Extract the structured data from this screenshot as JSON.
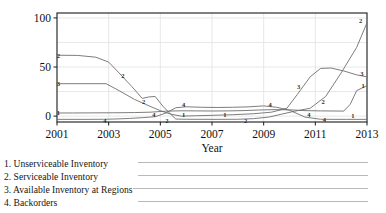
{
  "chart_data": {
    "type": "line",
    "title": "",
    "xlabel": "Year",
    "ylabel": "",
    "xlim": [
      2001,
      2013
    ],
    "ylim": [
      -6,
      105
    ],
    "grid": true,
    "legend_position": "below-left",
    "yticks": [
      "0",
      "50",
      "100"
    ],
    "ytick_values": [
      0,
      50,
      100
    ],
    "xticks": [
      "2001",
      "2003",
      "2005",
      "2007",
      "2009",
      "2011",
      "2013"
    ],
    "xtick_values": [
      2001,
      2003,
      2005,
      2007,
      2009,
      2011,
      2013
    ],
    "series": [
      {
        "key": "1",
        "name": "Unserviceable Inventory",
        "inline_labels": [
          "1",
          "1",
          "1",
          "1",
          "1"
        ],
        "x": [
          2001,
          2001.6,
          2002.4,
          2003.2,
          2004.0,
          2004.6,
          2005.2,
          2005.8,
          2006.4,
          2007.0,
          2007.6,
          2008.2,
          2008.8,
          2009.4,
          2010.0,
          2010.6,
          2011.2,
          2011.8,
          2012.1,
          2012.35,
          2012.6,
          2013
        ],
        "y": [
          3.2,
          3.2,
          3.3,
          3.4,
          3.6,
          4.0,
          5.0,
          5.4,
          5.3,
          5.2,
          5.3,
          5.6,
          6.2,
          6.6,
          6.4,
          5.6,
          5.3,
          5.2,
          5.1,
          12.0,
          26.0,
          31.0
        ]
      },
      {
        "key": "2",
        "name": "Serviceable Inventory",
        "inline_labels": [
          "2",
          "2",
          "2",
          "2",
          "2",
          "2"
        ],
        "x": [
          2001,
          2001.8,
          2002.5,
          2003.0,
          2003.4,
          2003.9,
          2004.3,
          2004.55,
          2004.8,
          2005.1,
          2005.4,
          2005.6,
          2006.0,
          2007.0,
          2008.0,
          2008.6,
          2009.2,
          2009.7,
          2010.2,
          2010.8,
          2011.4,
          2012.0,
          2012.6,
          2013
        ],
        "y": [
          62.0,
          61.8,
          60.0,
          55.0,
          44.0,
          30.0,
          18.0,
          19.5,
          20.0,
          10.0,
          2.0,
          -3.0,
          -3.2,
          -3.3,
          -3.2,
          -2.6,
          -1.0,
          2.0,
          5.0,
          8.0,
          20.0,
          44.0,
          70.0,
          95.0
        ]
      },
      {
        "key": "3",
        "name": "Available Inventory at Regions",
        "inline_labels": [
          "3",
          "3"
        ],
        "x": [
          2001,
          2002.0,
          2002.9,
          2003.4,
          2004.0,
          2004.6,
          2005.0,
          2005.4,
          2005.8,
          2006.4,
          2007.0,
          2007.8,
          2008.6,
          2009.3,
          2009.9,
          2010.3,
          2010.8,
          2011.2,
          2011.6,
          2012.1,
          2012.6,
          2013
        ],
        "y": [
          33.0,
          33.0,
          33.0,
          26.0,
          17.0,
          10.0,
          5.5,
          2.0,
          0.0,
          0.4,
          0.8,
          1.4,
          2.4,
          4.0,
          8.0,
          22.0,
          40.0,
          48.5,
          49.0,
          46.0,
          42.0,
          40.0
        ]
      },
      {
        "key": "4",
        "name": "Backorders",
        "inline_labels": [
          "4",
          "4",
          "4",
          "4",
          "4"
        ],
        "x": [
          2001,
          2002.2,
          2002.8,
          2003.2,
          2003.8,
          2004.3,
          2004.8,
          2005.2,
          2005.6,
          2006.0,
          2006.6,
          2007.2,
          2007.8,
          2008.4,
          2009.0,
          2009.5,
          2010.0,
          2010.6,
          2011.2,
          2011.8,
          2012.2,
          2013
        ],
        "y": [
          -3.3,
          -3.3,
          -3.2,
          -3.0,
          -2.4,
          -1.6,
          -0.6,
          3.0,
          8.5,
          9.5,
          9.0,
          8.8,
          9.0,
          9.4,
          10.4,
          9.0,
          6.0,
          -1.0,
          -3.2,
          -3.3,
          -3.3,
          -3.3
        ]
      }
    ],
    "inline_markers": [
      {
        "series": "2",
        "x": 2001.05,
        "y": 62.0
      },
      {
        "series": "2",
        "x": 2003.55,
        "y": 41.0
      },
      {
        "series": "2",
        "x": 2004.35,
        "y": 14.5
      },
      {
        "series": "2",
        "x": 2005.25,
        "y": -4.2
      },
      {
        "series": "2",
        "x": 2008.3,
        "y": -4.2
      },
      {
        "series": "2",
        "x": 2011.3,
        "y": 15.0
      },
      {
        "series": "2",
        "x": 2012.75,
        "y": 97.0
      },
      {
        "series": "3",
        "x": 2001.05,
        "y": 33.0
      },
      {
        "series": "3",
        "x": 2010.35,
        "y": 30.0
      },
      {
        "series": "3",
        "x": 2012.8,
        "y": 43.0
      },
      {
        "series": "1",
        "x": 2001.05,
        "y": 3.2
      },
      {
        "series": "1",
        "x": 2005.9,
        "y": 1.2
      },
      {
        "series": "1",
        "x": 2007.5,
        "y": 1.2
      },
      {
        "series": "1",
        "x": 2012.45,
        "y": 0.5
      },
      {
        "series": "1",
        "x": 2012.85,
        "y": 31.0
      },
      {
        "series": "4",
        "x": 2002.85,
        "y": -4.0
      },
      {
        "series": "4",
        "x": 2004.75,
        "y": 1.8
      },
      {
        "series": "4",
        "x": 2005.9,
        "y": 11.5
      },
      {
        "series": "4",
        "x": 2009.25,
        "y": 11.5
      },
      {
        "series": "4",
        "x": 2010.75,
        "y": 1.5
      },
      {
        "series": "4",
        "x": 2011.35,
        "y": -3.0
      }
    ]
  },
  "legend": {
    "items": [
      {
        "text": "1. Unserviceable Inventory"
      },
      {
        "text": "2. Serviceable Inventory"
      },
      {
        "text": "3. Available Inventory at Regions"
      },
      {
        "text": "4. Backorders"
      }
    ]
  },
  "axis": {
    "x_title": "Year"
  },
  "colors": {
    "line": "#6e6e6e",
    "axis": "#1a1a1a",
    "grid": "#e2e2e2",
    "legend_line": "#b9b9b9",
    "text": "#141414"
  }
}
